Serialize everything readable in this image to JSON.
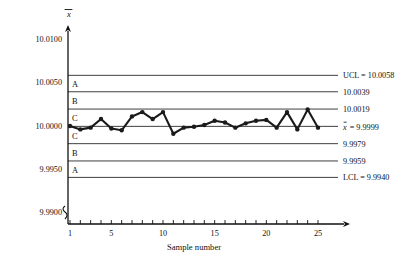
{
  "chart_data": {
    "type": "line",
    "title": "",
    "xlabel": "Sample number",
    "ylabel": "x̄",
    "x": [
      1,
      2,
      3,
      4,
      5,
      6,
      7,
      8,
      9,
      10,
      11,
      12,
      13,
      14,
      15,
      16,
      17,
      18,
      19,
      20,
      21,
      22,
      23,
      24,
      25
    ],
    "values": [
      9.99995,
      9.99955,
      9.99975,
      10.00075,
      9.99965,
      9.99945,
      10.00105,
      10.00155,
      10.00075,
      10.00155,
      9.99905,
      9.99975,
      9.99985,
      10.00005,
      10.00055,
      10.00035,
      9.99975,
      10.00025,
      10.00055,
      10.00065,
      9.99975,
      10.00155,
      9.99955,
      10.00185,
      9.99975
    ],
    "ylim": [
      9.99,
      10.0125
    ],
    "xlim": [
      0,
      26
    ],
    "grid": false,
    "legend_position": "none",
    "y_ticks": [
      "10.0100",
      "10.0050",
      "10.0000",
      "9.9950",
      "9.9900"
    ],
    "y_tick_values": [
      10.01,
      10.005,
      10.0,
      9.995,
      9.99
    ],
    "x_ticks": [
      "1",
      "5",
      "10",
      "15",
      "20",
      "25"
    ],
    "x_tick_values": [
      1,
      5,
      10,
      15,
      20,
      25
    ],
    "control_lines": [
      {
        "name": "ucl",
        "value": 10.0058,
        "label": "UCL = 10.0058"
      },
      {
        "name": "zone-a-b",
        "value": 10.0039,
        "label": "10.0039"
      },
      {
        "name": "zone-b-c",
        "value": 10.0019,
        "label": "10.0019"
      },
      {
        "name": "center",
        "value": 9.9999,
        "label": "═ = 9.9999",
        "label_prefix": "x"
      },
      {
        "name": "zone-c-b",
        "value": 9.9979,
        "label": "9.9979"
      },
      {
        "name": "zone-b-a",
        "value": 9.9959,
        "label": "9.9959"
      },
      {
        "name": "lcl",
        "value": 9.994,
        "label": "LCL = 9.9940"
      }
    ],
    "zone_letters": [
      "A",
      "B",
      "C",
      "C",
      "B",
      "A"
    ],
    "center_label_symbol": "x",
    "center_label_value": "= 9.9999",
    "marker": "filled-circle",
    "line_color": "#1a1a1a"
  }
}
